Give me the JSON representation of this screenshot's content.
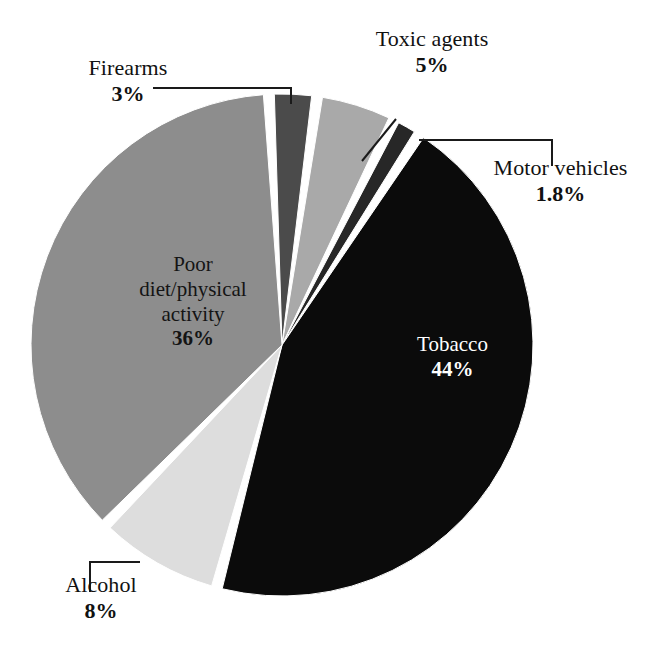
{
  "chart_data": {
    "type": "pie",
    "title": "",
    "subtitle": "",
    "xlabel": "",
    "ylabel": "",
    "legend": "none",
    "grid": false,
    "label_format": "name + percent",
    "start_angle_deg": -3,
    "direction": "clockwise",
    "categories": [
      "Firearms",
      "Toxic agents",
      "Motor vehicles",
      "Tobacco",
      "Alcohol",
      "Poor diet/physical activity"
    ],
    "values": [
      3,
      5,
      1.8,
      44,
      8,
      36
    ],
    "value_labels": [
      "3%",
      "5%",
      "1.8%",
      "44%",
      "8%",
      "36%"
    ],
    "colors": [
      "#4b4b4b",
      "#a9a9a9",
      "#272727",
      "#0b0b0b",
      "#dddddd",
      "#8d8d8d"
    ],
    "slices": [
      {
        "label": "Firearms",
        "value": 3,
        "value_label": "3%",
        "color": "#4b4b4b",
        "label_placement": "outside",
        "text_color": "#111111"
      },
      {
        "label": "Toxic agents",
        "value": 5,
        "value_label": "5%",
        "color": "#a9a9a9",
        "label_placement": "outside",
        "text_color": "#111111"
      },
      {
        "label": "Motor vehicles",
        "value": 1.8,
        "value_label": "1.8%",
        "color": "#272727",
        "label_placement": "outside",
        "text_color": "#111111"
      },
      {
        "label": "Tobacco",
        "value": 44,
        "value_label": "44%",
        "color": "#0b0b0b",
        "label_placement": "inside",
        "text_color": "#ffffff"
      },
      {
        "label": "Alcohol",
        "value": 8,
        "value_label": "8%",
        "color": "#dddddd",
        "label_placement": "outside",
        "text_color": "#111111"
      },
      {
        "label": "Poor diet/physical activity",
        "value": 36,
        "value_label": "36%",
        "color": "#8d8d8d",
        "label_placement": "inside",
        "text_color": "#141414"
      }
    ],
    "background_color": "#ffffff",
    "slice_gap_color": "#ffffff"
  },
  "labels": {
    "firearms": {
      "name": "Firearms",
      "pct": "3%"
    },
    "toxic_agents": {
      "name": "Toxic agents",
      "pct": "5%"
    },
    "motor_vehicles": {
      "name": "Motor vehicles",
      "pct": "1.8%"
    },
    "tobacco": {
      "name": "Tobacco",
      "pct": "44%"
    },
    "alcohol": {
      "name": "Alcohol",
      "pct": "8%"
    },
    "poor_diet": {
      "line1": "Poor",
      "line2": "diet/physical",
      "line3": "activity",
      "pct": "36%"
    }
  }
}
